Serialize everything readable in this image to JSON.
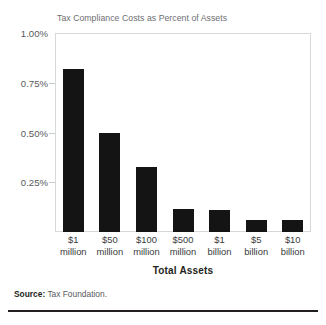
{
  "chart_data": {
    "type": "bar",
    "title": "Tax Compliance Costs as Percent of Assets",
    "xlabel": "Total Assets",
    "ylabel": "",
    "categories": [
      "$1 million",
      "$50 million",
      "$100 million",
      "$500 million",
      "$1 billion",
      "$5 billion",
      "$10 billion"
    ],
    "category_lines": [
      {
        "line1": "$1",
        "line2": "million"
      },
      {
        "line1": "$50",
        "line2": "million"
      },
      {
        "line1": "$100",
        "line2": "million"
      },
      {
        "line1": "$500",
        "line2": "million"
      },
      {
        "line1": "$1",
        "line2": "billion"
      },
      {
        "line1": "$5",
        "line2": "billion"
      },
      {
        "line1": "$10",
        "line2": "billion"
      }
    ],
    "values": [
      0.82,
      0.495,
      0.325,
      0.115,
      0.11,
      0.06,
      0.06
    ],
    "ylim": [
      0,
      1.0
    ],
    "y_ticks": [
      1.0,
      0.75,
      0.5,
      0.25
    ],
    "y_tick_labels": [
      "1.00%",
      "0.75%",
      "0.50%",
      "0.25%"
    ],
    "grid": false,
    "legend": "none",
    "bar_color": "#141414",
    "frame_color": "#d7d8da"
  },
  "source": {
    "label": "Source:",
    "text": "Tax Foundation."
  }
}
